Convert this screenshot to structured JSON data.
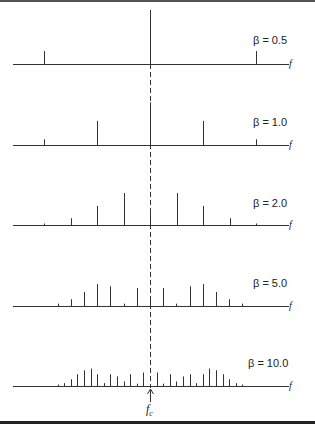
{
  "figure": {
    "axis_label": "f",
    "carrier_label": "f",
    "carrier_subscript": "c",
    "center_x": 150,
    "rows": [
      {
        "label": "β = 0.5",
        "beta": 0.5,
        "baseline_y": 64,
        "spacing": 106,
        "amplitudes": [
          0.24,
          0.94,
          0.24
        ]
      },
      {
        "label": "β = 1.0",
        "beta": 1.0,
        "baseline_y": 145,
        "spacing": 53,
        "amplitudes": [
          0.11,
          0.44,
          0.77,
          0.44,
          0.11
        ]
      },
      {
        "label": "β = 2.0",
        "beta": 2.0,
        "baseline_y": 225,
        "spacing": 26.5,
        "amplitudes": [
          0.03,
          0.13,
          0.35,
          0.58,
          0.22,
          0.58,
          0.35,
          0.13,
          0.03
        ]
      },
      {
        "label": "β = 5.0",
        "beta": 5.0,
        "baseline_y": 306,
        "spacing": 13.2,
        "amplitudes": [
          0.05,
          0.13,
          0.26,
          0.4,
          0.36,
          0.05,
          0.33,
          0.18,
          0.33,
          0.05,
          0.36,
          0.4,
          0.26,
          0.13,
          0.05
        ]
      },
      {
        "label": "β = 10.0",
        "beta": 10.0,
        "baseline_y": 386,
        "spacing": 6.6,
        "amplitudes": [
          0.03,
          0.06,
          0.13,
          0.22,
          0.29,
          0.32,
          0.22,
          0.06,
          0.22,
          0.18,
          0.09,
          0.22,
          0.05,
          0.25,
          0.04,
          0.25,
          0.05,
          0.22,
          0.09,
          0.18,
          0.22,
          0.06,
          0.22,
          0.32,
          0.29,
          0.22,
          0.13,
          0.06,
          0.03
        ]
      }
    ]
  }
}
